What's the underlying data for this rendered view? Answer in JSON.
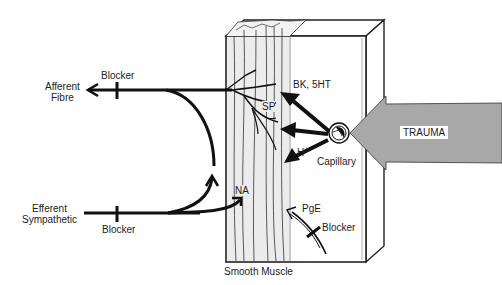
{
  "diagram": {
    "labels": {
      "afferent": "Afferent\nFibre",
      "afferent_line1": "Afferent",
      "afferent_line2": "Fibre",
      "blocker_top": "Blocker",
      "efferent_line1": "Efferent",
      "efferent_line2": "Sympathetic",
      "blocker_bottom": "Blocker",
      "bk_5ht": "BK, 5HT",
      "sp": "SP",
      "h_plus": "H+",
      "h": "H",
      "plus": "+",
      "capillary": "Capillary",
      "trauma": "TRAUMA",
      "na": "NA",
      "pge": "PgE",
      "blocker_pge": "Blocker",
      "smooth_muscle": "Smooth Muscle"
    },
    "colors": {
      "line": "#111111",
      "trauma_arrow": "#a8a8a8",
      "muscle_strip": "#eeeeee",
      "background": "#ffffff"
    }
  }
}
